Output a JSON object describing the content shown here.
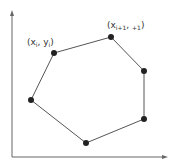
{
  "diagram": {
    "type": "polygon-vertices",
    "vertices": [
      {
        "x": 31,
        "y": 100
      },
      {
        "x": 54,
        "y": 53
      },
      {
        "x": 111,
        "y": 37
      },
      {
        "x": 144,
        "y": 71
      },
      {
        "x": 144,
        "y": 119
      },
      {
        "x": 86,
        "y": 143
      }
    ],
    "labels": {
      "vertex_i": {
        "open": "(x",
        "sub1": "i",
        "mid": ", y",
        "sub2": "i",
        "close": ")"
      },
      "vertex_i1": {
        "open": "(x",
        "sub1": "i+1",
        "mid": ", ",
        "sub2": "+1",
        "close": ")"
      }
    },
    "colors": {
      "line": "#555555",
      "point": "#222222",
      "axis": "#666666"
    }
  }
}
